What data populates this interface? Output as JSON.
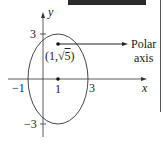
{
  "diagram": {
    "type": "ellipse-polar",
    "axes": {
      "x_label": "x",
      "y_label": "y"
    },
    "ticks": {
      "x": [
        {
          "value": -1,
          "label": "−1"
        },
        {
          "value": 1,
          "label": "1"
        },
        {
          "value": 3,
          "label": "3"
        }
      ],
      "y": [
        {
          "value": 3,
          "label": "3"
        },
        {
          "value": -3,
          "label": "−3"
        }
      ]
    },
    "ellipse": {
      "center": [
        1,
        0
      ],
      "semi_major_vertical": 3,
      "semi_minor_horizontal": 2
    },
    "points": [
      {
        "name": "focus",
        "coords": [
          1,
          2.236
        ],
        "label_prefix": "(1,",
        "label_sqrt": "5",
        "label_suffix": ")"
      },
      {
        "name": "center",
        "coords": [
          1,
          0
        ]
      }
    ],
    "annotation": {
      "line1": "Polar",
      "line2": "axis"
    },
    "colors": {
      "ink": "#222222",
      "topbar": "#2b2b2b"
    }
  }
}
